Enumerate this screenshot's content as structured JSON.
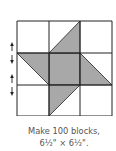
{
  "diagram": {
    "type": "quilt-block",
    "grid": {
      "rows": 3,
      "cols": 3,
      "x": [
        17,
        49,
        80,
        112
      ],
      "y": [
        21,
        53,
        85,
        116
      ]
    },
    "colors": {
      "fill": "#a8a8a8",
      "line": "#222222",
      "background": "#ffffff"
    },
    "shaded_polygons": [
      {
        "name": "center-square",
        "points": "49,53 80,53 80,85 49,85"
      },
      {
        "name": "top-point",
        "points": "49,53 80,21 80,53"
      },
      {
        "name": "left-point",
        "points": "17,53 49,53 49,85"
      },
      {
        "name": "right-point",
        "points": "80,53 80,85 112,85"
      },
      {
        "name": "bottom-point",
        "points": "49,85 80,85 49,116"
      }
    ],
    "rotation_arrows": [
      {
        "y": 53
      },
      {
        "y": 85
      }
    ]
  },
  "caption": {
    "line1": "Make 100 blocks,",
    "line2": "6½\" × 6½\"."
  }
}
